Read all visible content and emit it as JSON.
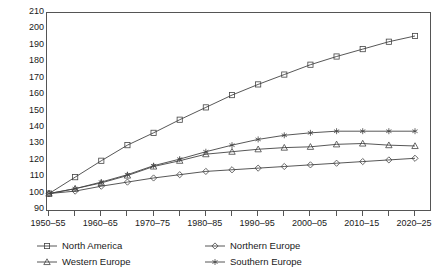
{
  "chart_data": {
    "type": "line",
    "title": "",
    "subtitle": "",
    "xlabel": "",
    "ylabel": "",
    "ylim": [
      90,
      210
    ],
    "ytick_step": 10,
    "yticks": [
      90,
      100,
      110,
      120,
      130,
      140,
      150,
      160,
      170,
      180,
      190,
      200,
      210
    ],
    "grid": false,
    "legend_position": "bottom",
    "x": [
      "1950-55",
      "1955-60",
      "1960-65",
      "1965-70",
      "1970-75",
      "1975-80",
      "1980-85",
      "1985-90",
      "1990-95",
      "1995-00",
      "2000-05",
      "2005-10",
      "2010-15",
      "2015-20",
      "2020-25"
    ],
    "categories": [
      "1950-55",
      "1955-60",
      "1960-65",
      "1965-70",
      "1970-75",
      "1975-80",
      "1980-85",
      "1985-90",
      "1990-95",
      "1995-00",
      "2000-05",
      "2005-10",
      "2010-15",
      "2015-20",
      "2020-25"
    ],
    "xtick_labels": [
      "1950–55",
      "1960–65",
      "1970–75",
      "1980–85",
      "1990–95",
      "2000–05",
      "2010–15",
      "2020–25"
    ],
    "xtick_label_indices": [
      0,
      2,
      4,
      6,
      8,
      10,
      12,
      14
    ],
    "series": [
      {
        "name": "North America",
        "marker": "square",
        "color": "#444444",
        "values": [
          100,
          110,
          120,
          129.5,
          137,
          145,
          152.5,
          160,
          166.5,
          172.5,
          178.5,
          183.5,
          188,
          192.5,
          196
        ]
      },
      {
        "name": "Northern Europe",
        "marker": "diamond",
        "color": "#444444",
        "values": [
          100,
          101.5,
          104.5,
          107,
          109.5,
          111.5,
          113.5,
          114.5,
          115.5,
          116.5,
          117.5,
          118.5,
          119.5,
          120.5,
          121.5
        ]
      },
      {
        "name": "Western Europe",
        "marker": "triangle",
        "color": "#444444",
        "values": [
          100,
          103,
          106.5,
          111,
          116.5,
          120,
          124,
          125.5,
          127,
          128,
          128.5,
          130,
          130.5,
          129.5,
          129
        ]
      },
      {
        "name": "Southern Europe",
        "marker": "star",
        "color": "#444444",
        "values": [
          100,
          103,
          107,
          111.5,
          117,
          121,
          125.5,
          129.5,
          133,
          135.5,
          137,
          138,
          138,
          138,
          138
        ]
      }
    ]
  },
  "legend": {
    "items": [
      {
        "label": "North America",
        "marker": "square",
        "row": 0,
        "col": 0
      },
      {
        "label": "Northern Europe",
        "marker": "diamond",
        "row": 0,
        "col": 1
      },
      {
        "label": "Western Europe",
        "marker": "triangle",
        "row": 1,
        "col": 0
      },
      {
        "label": "Southern Europe",
        "marker": "star",
        "row": 1,
        "col": 1
      }
    ]
  },
  "style": {
    "axis_color": "#555555",
    "line_color": "#444444",
    "background": "#ffffff",
    "text_color": "#1a1a1a"
  }
}
